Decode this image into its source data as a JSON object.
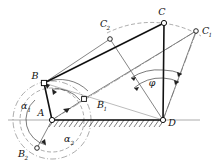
{
  "figure": {
    "kind": "kinematic-linkage-diagram",
    "background": "#ffffff",
    "line_color": "#111111",
    "thin_color": "#555555"
  },
  "labels": {
    "A": "A",
    "B": "B",
    "C": "C",
    "D": "D",
    "B1_base": "B",
    "B1_sub": "1",
    "B2_base": "B",
    "B2_sub": "2",
    "C1_base": "C",
    "C1_sub": "1",
    "C2_base": "C",
    "C2_sub": "2",
    "alpha1_base": "α",
    "alpha1_sub": "1",
    "alpha2_base": "α",
    "alpha2_sub": "2",
    "phi": "φ"
  },
  "points": {
    "A": {
      "x": 52,
      "y": 120,
      "marker": "circle",
      "label_dx": -11,
      "label_dy": -5
    },
    "B": {
      "x": 44,
      "y": 83,
      "marker": "square",
      "label_dx": -10,
      "label_dy": -5
    },
    "C": {
      "x": 164,
      "y": 23,
      "marker": "circle",
      "label_dx": -3,
      "label_dy": -7
    },
    "D": {
      "x": 163,
      "y": 120,
      "marker": "circle",
      "label_dx": 8,
      "label_dy": 4
    },
    "B1": {
      "x": 84,
      "y": 99,
      "marker": "square",
      "label_dx": 14,
      "label_dy": 8
    },
    "B2": {
      "x": 37,
      "y": 148,
      "marker": "circle",
      "label_dx": -14,
      "label_dy": 4
    },
    "C1": {
      "x": 196,
      "y": 31,
      "marker": "circle",
      "label_dx": 7,
      "label_dy": 3
    },
    "C2": {
      "x": 110,
      "y": 39,
      "marker": "circle",
      "label_dx": -6,
      "label_dy": -8
    }
  },
  "links": [
    {
      "name": "crank-AB",
      "from": "A",
      "to": "B",
      "weight": "thick"
    },
    {
      "name": "coupler-BC",
      "from": "B",
      "to": "C",
      "weight": "thick"
    },
    {
      "name": "rocker-CD",
      "from": "C",
      "to": "D",
      "weight": "thick"
    },
    {
      "name": "crank-A-B1",
      "from": "A",
      "to": "B1",
      "weight": "thin"
    },
    {
      "name": "coupler-B1-C1",
      "from": "B1",
      "to": "C1",
      "weight": "thin"
    },
    {
      "name": "rocker-C1-D",
      "from": "C1",
      "to": "D",
      "weight": "thin"
    },
    {
      "name": "coupler-B-C2",
      "from": "B",
      "to": "C2",
      "weight": "thin"
    },
    {
      "name": "rocker-C2-D",
      "from": "C2",
      "to": "D",
      "weight": "thin"
    },
    {
      "name": "crank-A-B2",
      "from": "A",
      "to": "B2",
      "weight": "thin"
    }
  ],
  "ground": {
    "name": "ground-link-AD",
    "x1": 52,
    "y1": 120,
    "x2": 163,
    "y2": 120,
    "hatch_count": 22,
    "hatch_len": 6,
    "axis_x1": 8,
    "axis_x2": 200
  },
  "angles": {
    "alpha1": {
      "label_x": 27,
      "label_y": 106,
      "desc": "crank rotation angle 1"
    },
    "alpha2": {
      "label_x": 70,
      "label_y": 139,
      "desc": "crank rotation angle 2"
    },
    "phi": {
      "label_x": 151,
      "label_y": 84,
      "desc": "rocker swing angle at D"
    }
  },
  "arcs": {
    "crank_circle_outer": {
      "cx": 52,
      "cy": 120,
      "r": 39,
      "style": "dash-dot"
    },
    "crank_circle_inner": {
      "cx": 52,
      "cy": 120,
      "r": 32,
      "style": "dashed"
    },
    "rocker_arc_C": {
      "cx": 163,
      "cy": 120,
      "r": 98,
      "style": "dashed"
    }
  }
}
